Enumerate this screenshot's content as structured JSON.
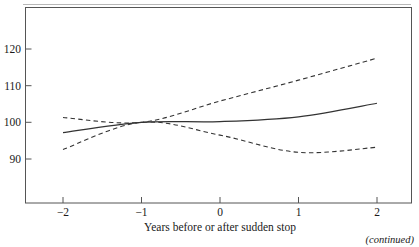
{
  "figure": {
    "footer_note": "(continued)"
  },
  "chart_data": {
    "type": "line",
    "title": "",
    "subtitle": "",
    "xlabel": "Years before or after sudden stop",
    "ylabel": "",
    "x": [
      -2,
      -1,
      0,
      1,
      2
    ],
    "xticks": [
      -2,
      -1,
      0,
      1,
      2
    ],
    "xtick_labels": [
      "−2",
      "−1",
      "0",
      "1",
      "2"
    ],
    "yticks": [
      90,
      100,
      110,
      120
    ],
    "ytick_labels": [
      "90",
      "100",
      "110",
      "120"
    ],
    "xlim": [
      -2.5,
      2.5
    ],
    "ylim": [
      84,
      126
    ],
    "grid": false,
    "legend": null,
    "frame": "box",
    "series": [
      {
        "name": "central estimate",
        "style": "solid",
        "color": "#333333",
        "values": [
          97.2,
          100.0,
          100.2,
          101.5,
          105.2
        ]
      },
      {
        "name": "upper confidence band",
        "style": "dashed",
        "color": "#333333",
        "values": [
          101.3,
          100.0,
          105.8,
          111.5,
          117.5
        ]
      },
      {
        "name": "lower confidence band",
        "style": "dashed",
        "color": "#333333",
        "values": [
          92.6,
          100.0,
          96.5,
          91.8,
          93.2
        ]
      }
    ]
  }
}
